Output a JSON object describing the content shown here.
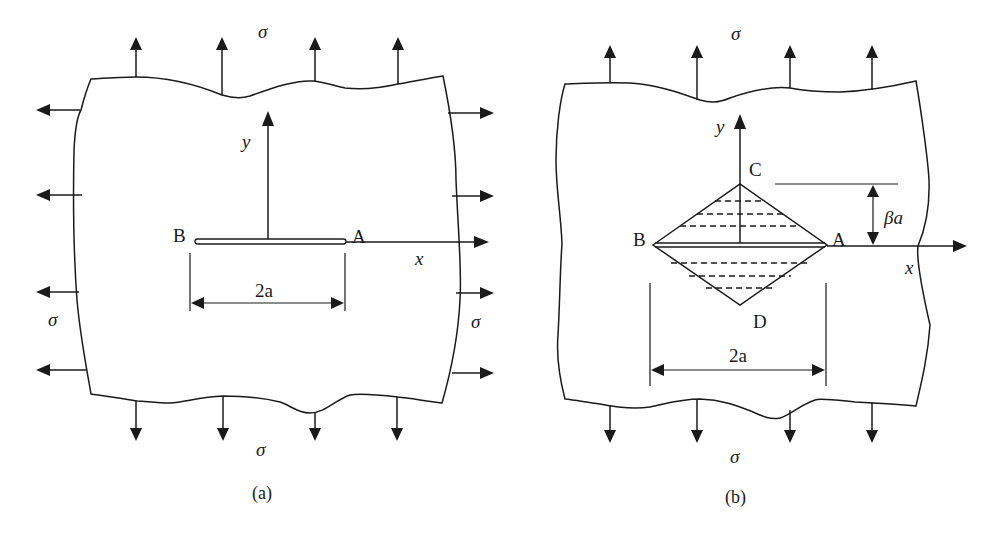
{
  "figure": {
    "panel_a": {
      "caption": "(a)",
      "stress_label_top": "σ",
      "stress_label_bottom": "σ",
      "stress_label_left": "σ",
      "stress_label_right": "σ",
      "axis_y_label": "y",
      "axis_x_label": "x",
      "crack_tip_left": "B",
      "crack_tip_right": "A",
      "crack_length_label": "2a"
    },
    "panel_b": {
      "caption": "(b)",
      "stress_label_top": "σ",
      "stress_label_bottom": "σ",
      "axis_y_label": "y",
      "axis_x_label": "x",
      "vertex_left": "B",
      "vertex_right": "A",
      "vertex_top": "C",
      "vertex_bottom": "D",
      "height_label": "βa",
      "crack_length_label": "2a"
    },
    "colors": {
      "ink": "#1a1a1a",
      "background": "#ffffff"
    }
  }
}
